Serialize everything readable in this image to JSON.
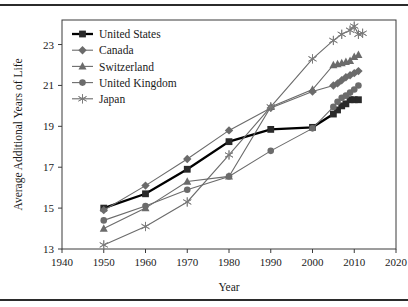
{
  "figure": {
    "top_rule": "horizontal-rule",
    "bottom_rule": "horizontal-rule"
  },
  "chart_data": {
    "type": "line",
    "title": "",
    "xlabel": "Year",
    "ylabel": "Average Additional Years of Life",
    "xlim": [
      1940,
      2020
    ],
    "ylim": [
      13,
      24.2
    ],
    "xticks": [
      1940,
      1950,
      1960,
      1970,
      1980,
      1990,
      2000,
      2010,
      2020
    ],
    "yticks": [
      13,
      15,
      17,
      19,
      21,
      23
    ],
    "grid": false,
    "legend_position": "top-left inside",
    "series": [
      {
        "name": "United States",
        "marker": "square",
        "color": "#2a2a2a",
        "line_color": "#000000",
        "emphasis": true,
        "x": [
          1950,
          1960,
          1970,
          1980,
          1990,
          2000,
          2005,
          2006,
          2007,
          2008,
          2009,
          2010,
          2011
        ],
        "y": [
          15.0,
          15.7,
          16.9,
          18.25,
          18.85,
          18.95,
          19.6,
          19.8,
          20.0,
          20.1,
          20.3,
          20.3,
          20.3
        ]
      },
      {
        "name": "Canada",
        "marker": "diamond",
        "color": "#6b6b6b",
        "line_color": "#6b6b6b",
        "emphasis": false,
        "x": [
          1950,
          1960,
          1970,
          1980,
          1990,
          2000,
          2005,
          2006,
          2007,
          2008,
          2009,
          2010,
          2011
        ],
        "y": [
          14.9,
          16.1,
          17.4,
          18.8,
          19.9,
          20.7,
          21.0,
          21.1,
          21.25,
          21.4,
          21.5,
          21.6,
          21.7
        ]
      },
      {
        "name": "Switzerland",
        "marker": "triangle",
        "color": "#6b6b6b",
        "line_color": "#6b6b6b",
        "emphasis": false,
        "x": [
          1950,
          1960,
          1970,
          1980,
          1990,
          2000,
          2005,
          2006,
          2007,
          2008,
          2009,
          2010,
          2011
        ],
        "y": [
          14.0,
          15.0,
          16.3,
          16.55,
          19.95,
          20.8,
          22.0,
          22.05,
          22.1,
          22.15,
          22.2,
          22.4,
          22.5
        ]
      },
      {
        "name": "United Kingdom",
        "marker": "circle",
        "color": "#6b6b6b",
        "line_color": "#6b6b6b",
        "emphasis": false,
        "x": [
          1950,
          1960,
          1970,
          1980,
          1990,
          2000,
          2005,
          2006,
          2007,
          2008,
          2009,
          2010,
          2011
        ],
        "y": [
          14.4,
          15.1,
          15.9,
          16.55,
          17.8,
          18.9,
          19.95,
          20.2,
          20.4,
          20.5,
          20.65,
          20.8,
          21.0
        ]
      },
      {
        "name": "Japan",
        "marker": "asterisk",
        "color": "#7a7a7a",
        "line_color": "#7a7a7a",
        "emphasis": false,
        "x": [
          1950,
          1960,
          1970,
          1980,
          1990,
          2000,
          2005,
          2007,
          2009,
          2010,
          2011,
          2012
        ],
        "y": [
          13.2,
          14.1,
          15.3,
          17.6,
          19.95,
          22.3,
          23.2,
          23.5,
          23.7,
          23.9,
          23.5,
          23.55
        ]
      }
    ]
  }
}
